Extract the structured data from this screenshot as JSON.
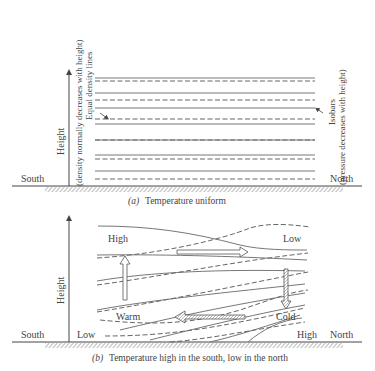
{
  "panel_a": {
    "caption_prefix": "(a)",
    "caption": "Temperature uniform",
    "y_axis_label": "Height",
    "left_note": "(density normally decreases with height)",
    "left_label": "Equal density lines",
    "right_label": "Isobars",
    "right_note": "(pressure decreases with height)",
    "south_label": "South",
    "north_label": "North"
  },
  "panel_b": {
    "caption_prefix": "(b)",
    "caption": "Temperature high in the south, low in the north",
    "y_axis_label": "Height",
    "south_label": "South",
    "north_label": "North",
    "high_top_label": "High",
    "low_top_label": "Low",
    "low_bottom_label": "Low",
    "high_bottom_label": "High",
    "warm_label": "Warm",
    "cold_label": "Cold"
  },
  "colors": {
    "line": "#777777",
    "text": "#444444",
    "hatch": "#888888"
  }
}
